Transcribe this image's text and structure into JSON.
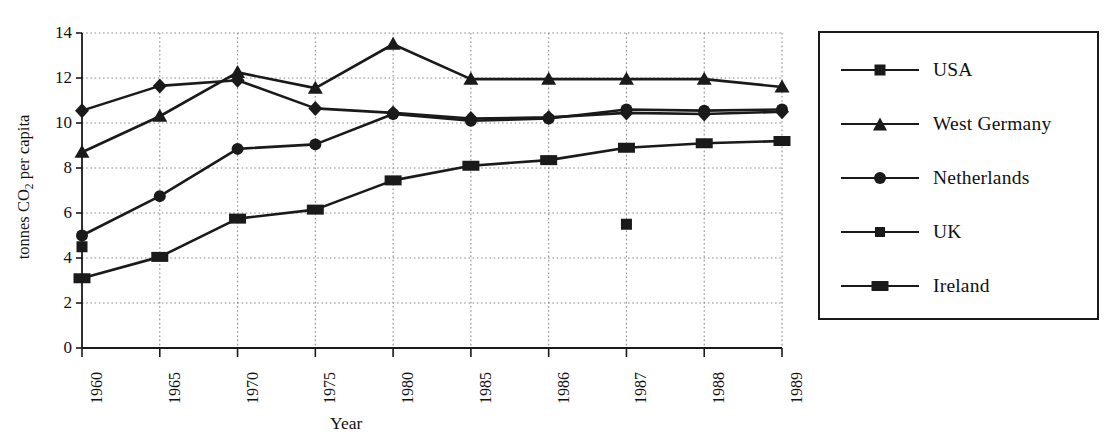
{
  "chart_data": {
    "type": "line",
    "title": "",
    "xlabel": "Year",
    "ylabel": "tonnes CO2 per capita",
    "ylabel_parts": {
      "pre": "tonnes CO",
      "sub": "2",
      "post": " per capita"
    },
    "categories": [
      "1960",
      "1965",
      "1970",
      "1975",
      "1980",
      "1985",
      "1986",
      "1987",
      "1988",
      "1989"
    ],
    "ylim": [
      0,
      14
    ],
    "yticks": [
      0,
      2,
      4,
      6,
      8,
      10,
      12,
      14
    ],
    "ytick_labels": [
      "0",
      "2",
      "4",
      "6",
      "8",
      "10",
      "12",
      "14"
    ],
    "grid": "dotted-both",
    "legend_position": "right-outside",
    "series": [
      {
        "name": "USA",
        "marker": "square",
        "values": [
          4.5,
          null,
          null,
          null,
          null,
          null,
          null,
          5.5,
          null,
          null
        ],
        "note": "only two markers visible: 1960 at 4.5 and an isolated point at 1987 at 5.5; no connecting line drawn"
      },
      {
        "name": "West Germany",
        "marker": "triangle",
        "values": [
          8.7,
          10.3,
          12.25,
          11.55,
          13.5,
          11.95,
          11.95,
          11.95,
          11.95,
          11.6
        ]
      },
      {
        "name": "Netherlands",
        "marker": "circle",
        "values": [
          5.0,
          6.75,
          8.85,
          9.05,
          10.4,
          10.1,
          10.2,
          10.6,
          10.55,
          10.6
        ]
      },
      {
        "name": "UK",
        "marker": "diamond",
        "values": [
          10.55,
          11.65,
          11.9,
          10.65,
          10.45,
          10.2,
          10.25,
          10.45,
          10.4,
          10.5
        ]
      },
      {
        "name": "Ireland",
        "marker": "wide-rect",
        "values": [
          3.1,
          4.05,
          5.75,
          6.15,
          7.45,
          8.1,
          8.35,
          8.9,
          9.1,
          9.2
        ]
      }
    ]
  },
  "legend": {
    "entries": [
      {
        "label": "USA",
        "marker": "square"
      },
      {
        "label": "West Germany",
        "marker": "triangle"
      },
      {
        "label": "Netherlands",
        "marker": "circle"
      },
      {
        "label": "UK",
        "marker": "diamond"
      },
      {
        "label": "Ireland",
        "marker": "wide-rect"
      }
    ]
  },
  "colors": {
    "ink": "#1a1a1a",
    "grid": "#8c8c8c",
    "background": "#ffffff"
  }
}
